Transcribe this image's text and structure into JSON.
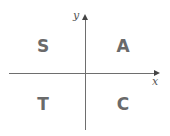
{
  "axes": {
    "x_label": "x",
    "y_label": "y"
  },
  "quadrants": {
    "top_left": "S",
    "top_right": "A",
    "bottom_left": "T",
    "bottom_right": "C"
  },
  "colors": {
    "axis": "#6e6e6e",
    "letters": "#6a6a6a"
  }
}
